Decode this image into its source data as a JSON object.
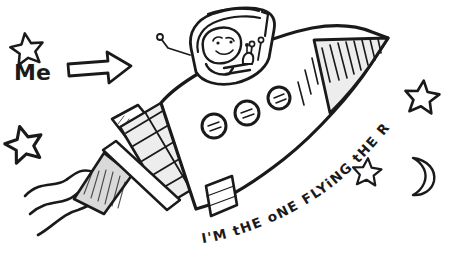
{
  "scene": {
    "title": "Hand-drawn rocket doodle",
    "background_color": "#ffffff",
    "ink_color": "#1a1a1a",
    "fill_light_gray": "#ededed",
    "fill_gray": "#d9d9d9"
  },
  "annotations": {
    "me_label": "Me",
    "caption": "I'M tHE oNE FLYiNG tHE ROCKET !",
    "caption_words": [
      "I'M",
      "tHE",
      "oNE",
      "FLYiNG",
      "tHE",
      "ROCKET",
      "!"
    ]
  },
  "icons": {
    "arrow": "arrow-right-icon",
    "star": "star-icon",
    "moon": "crescent-moon-icon",
    "porthole": "porthole-icon",
    "astronaut": "astronaut-icon",
    "exhaust": "exhaust-trail-icon",
    "rocket": "rocket-icon"
  },
  "elements": {
    "stars": [
      {
        "name": "star-top-left",
        "cx": 27,
        "cy": 49,
        "r": 17,
        "rot": -8
      },
      {
        "name": "star-mid-left",
        "cx": 24,
        "cy": 144,
        "r": 19,
        "rot": -14
      },
      {
        "name": "star-right-upper",
        "cx": 422,
        "cy": 97,
        "r": 18,
        "rot": 6
      },
      {
        "name": "star-right-lower",
        "cx": 367,
        "cy": 172,
        "r": 15,
        "rot": 4
      }
    ],
    "moon": {
      "name": "crescent-moon",
      "cx": 421,
      "cy": 172,
      "r": 16
    },
    "portholes": [
      {
        "name": "porthole-1",
        "cx": 214,
        "cy": 126,
        "r": 12
      },
      {
        "name": "porthole-2",
        "cx": 247,
        "cy": 113,
        "r": 12
      },
      {
        "name": "porthole-3",
        "cx": 279,
        "cy": 98,
        "r": 11
      }
    ],
    "nose_hatch_count": 11,
    "checker_rows": 7,
    "checker_cols": 2
  }
}
